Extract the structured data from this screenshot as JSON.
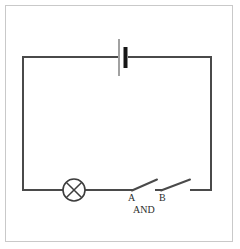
{
  "diagram": {
    "background_color": "#ffffff",
    "frame_color": "#c9c9c9",
    "wire_color": "#4a4a4a",
    "labels": {
      "switch_a": "A",
      "switch_b": "B",
      "gate": "AND"
    },
    "components": [
      {
        "name": "battery",
        "type": "cell",
        "position": "top-center",
        "long_plate_color": "#8a8a8a",
        "short_plate_color": "#161616"
      },
      {
        "name": "lamp",
        "type": "lamp-crossed-circle",
        "position": "bottom-left",
        "color": "#3d3d3d"
      },
      {
        "name": "switch-a",
        "type": "open-switch",
        "state": "open",
        "label": "A"
      },
      {
        "name": "switch-b",
        "type": "open-switch",
        "state": "open",
        "label": "B"
      }
    ],
    "geometry": {
      "loop_left": 22,
      "loop_right": 212,
      "loop_top": 57,
      "loop_bottom": 190
    }
  }
}
